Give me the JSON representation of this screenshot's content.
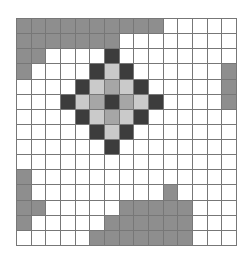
{
  "board": {
    "rows": 15,
    "cols": 15,
    "legend": {
      "w": "empty",
      "g": "gray-block",
      "d": "dark-block",
      "l": "light-block",
      "m": "medium-block"
    },
    "colors": {
      "w": "#ffffff",
      "g": "#8e8e8e",
      "d": "#3c3c3c",
      "l": "#cacaca",
      "m": "#a6a6a6",
      "grid": "#777777"
    },
    "grid": [
      "gggggggggg wwwww",
      "gggggggwwwwwwww",
      "ggwwwwdwwwwwwww",
      "gwwwwdldwwwwwwg",
      "wwwwdlmldwwwwwg",
      "wwwdlmdmldwwwwg",
      "wwwwdlmldwwwwww",
      "wwwwwdldwwwwwww",
      "wwwwwwdwwwwwwww",
      "wwwwwwwwwwwwwww",
      "gwwwwwwwwwwwwww",
      "gwwwwwwwwwgwwww",
      "ggwwwwwgggggwww",
      "gwwwwwggggggwww",
      "wwwwwgggggggwww"
    ]
  }
}
